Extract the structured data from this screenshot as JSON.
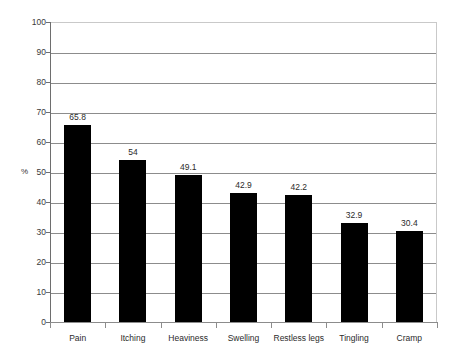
{
  "chart_data": {
    "type": "bar",
    "title": "",
    "subtitle": "",
    "xlabel": "",
    "ylabel": "%",
    "categories": [
      "Pain",
      "Itching",
      "Heaviness",
      "Swelling",
      "Restless legs",
      "Tingling",
      "Cramp"
    ],
    "values": [
      65.8,
      54,
      49.1,
      42.9,
      42.2,
      32.9,
      30.4
    ],
    "value_labels": [
      "65.8",
      "54",
      "49.1",
      "42.9",
      "42.2",
      "32.9",
      "30.4"
    ],
    "ylim": [
      0,
      100
    ],
    "ytick_labels": [
      "0",
      "10",
      "20",
      "30",
      "40",
      "50",
      "60",
      "70",
      "80",
      "90",
      "100"
    ],
    "ytick_values": [
      0,
      10,
      20,
      30,
      40,
      50,
      60,
      70,
      80,
      90,
      100
    ],
    "grid": true,
    "legend": false,
    "bar_color": "#000000",
    "grid_color": "#8c8c8c",
    "frame_color": "#c9c9c9",
    "axis_color": "#6e6e6e",
    "text_color": "#2b2b2b"
  }
}
